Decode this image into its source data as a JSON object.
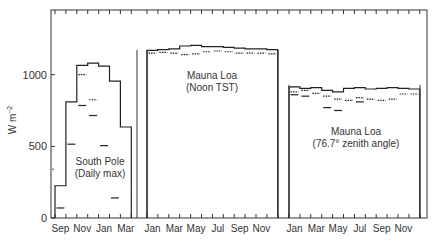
{
  "chart_data": {
    "type": "line",
    "title": "",
    "xlabel": "",
    "ylabel": "W m^-2",
    "ylim": [
      0,
      1400
    ],
    "yticks": [
      0,
      500,
      1000
    ],
    "panels": [
      {
        "name": "South Pole (Daily max)",
        "label_line1": "South Pole",
        "label_line2": "(Daily max)",
        "months": [
          "Sep",
          "Oct",
          "Nov",
          "Dec",
          "Jan",
          "Feb",
          "Mar"
        ],
        "tick_labels": [
          "Sep",
          "Nov",
          "Jan",
          "Mar"
        ],
        "series": [
          {
            "name": "upper step",
            "values": [
              225,
              810,
              1065,
              1080,
              1060,
              955,
              635
            ]
          },
          {
            "name": "dotted",
            "values": [
              null,
              null,
              1000,
              825,
              null,
              null,
              null
            ]
          },
          {
            "name": "dashes",
            "values": [
              70,
              515,
              785,
              715,
              505,
              140,
              null
            ]
          }
        ],
        "isolated_point": {
          "month": "Aug",
          "value": 340
        }
      },
      {
        "name": "Mauna Loa (Noon TST)",
        "label_line1": "Mauna Loa",
        "label_line2": "(Noon TST)",
        "months": [
          "Jan",
          "Feb",
          "Mar",
          "Apr",
          "May",
          "Jun",
          "Jul",
          "Aug",
          "Sep",
          "Oct",
          "Nov",
          "Dec"
        ],
        "tick_labels": [
          "Jan",
          "Mar",
          "May",
          "Jul",
          "Sep",
          "Nov"
        ],
        "series": [
          {
            "name": "upper step",
            "values": [
              1170,
              1175,
              1180,
              1200,
              1205,
              1195,
              1195,
              1190,
              1185,
              1180,
              1180,
              1175
            ]
          },
          {
            "name": "dotted",
            "values": [
              1150,
              1155,
              1150,
              1140,
              1145,
              1160,
              1165,
              1160,
              1150,
              1150,
              1150,
              1145
            ]
          }
        ]
      },
      {
        "name": "Mauna Loa (76.7° zenith angle)",
        "label_line1": "Mauna Loa",
        "label_line2": "(76.7° zenith angle)",
        "months": [
          "Jan",
          "Feb",
          "Mar",
          "Apr",
          "May",
          "Jun",
          "Jul",
          "Aug",
          "Sep",
          "Oct",
          "Nov",
          "Dec"
        ],
        "tick_labels": [
          "Jan",
          "Mar",
          "May",
          "Jul",
          "Sep",
          "Nov"
        ],
        "series": [
          {
            "name": "upper step",
            "values": [
              915,
              905,
              910,
              890,
              880,
              905,
              910,
              900,
              905,
              910,
              905,
              900
            ]
          },
          {
            "name": "dotted",
            "values": [
              880,
              890,
              870,
              850,
              830,
              820,
              840,
              830,
              820,
              830,
              865,
              865
            ]
          },
          {
            "name": "dashes",
            "values": [
              860,
              850,
              null,
              770,
              750,
              null,
              810,
              null,
              null,
              null,
              null,
              null
            ]
          }
        ]
      }
    ]
  },
  "axis": {
    "ylabel": "W m",
    "ylabel_sup": "−2",
    "y0": "0",
    "y500": "500",
    "y1000": "1000"
  },
  "panel_labels": {
    "sp1": "South Pole",
    "sp2": "(Daily max)",
    "ml1a": "Mauna Loa",
    "ml1b": "(Noon TST)",
    "ml2a": "Mauna Loa",
    "ml2b": "(76.7° zenith angle)"
  },
  "xticks": {
    "sp": [
      "Sep",
      "Nov",
      "Jan",
      "Mar"
    ],
    "ml1": [
      "Jan",
      "Mar",
      "May",
      "Jul",
      "Sep",
      "Nov"
    ],
    "ml2": [
      "Jan",
      "Mar",
      "May",
      "Jul",
      "Sep",
      "Nov"
    ]
  }
}
